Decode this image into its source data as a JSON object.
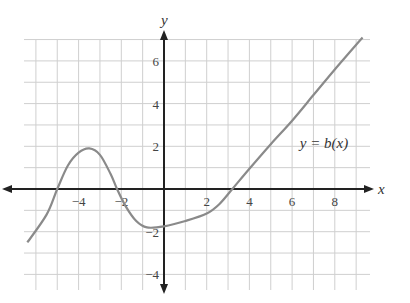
{
  "chart_data": {
    "type": "line",
    "title": "",
    "xlabel": "x",
    "ylabel": "y",
    "function_label": "y = b(x)",
    "xlim": [
      -6.5,
      9.5
    ],
    "ylim": [
      -4.5,
      7.5
    ],
    "grid": true,
    "x_ticks": [
      -4,
      -2,
      2,
      4,
      6,
      8
    ],
    "x_tick_labels": [
      "−4",
      "−2",
      "2",
      "4",
      "6",
      "8"
    ],
    "y_ticks": [
      6,
      4,
      2,
      -2,
      -4
    ],
    "y_tick_labels": [
      "6",
      "4",
      "2",
      "−2",
      "−4"
    ],
    "series": [
      {
        "name": "b(x)",
        "color": "#8a8a8a",
        "x": [
          -6.4,
          -5.5,
          -5.0,
          -4.5,
          -4.0,
          -3.5,
          -3.0,
          -2.5,
          -2.2,
          -1.8,
          -1.3,
          -0.8,
          0,
          1,
          2,
          2.6,
          3.2,
          4,
          5,
          6,
          7,
          8,
          9.3
        ],
        "y": [
          -2.5,
          -1.2,
          0,
          1.1,
          1.7,
          1.9,
          1.6,
          0.7,
          0,
          -0.8,
          -1.5,
          -1.8,
          -1.75,
          -1.5,
          -1.15,
          -0.7,
          0,
          0.95,
          2.1,
          3.2,
          4.4,
          5.6,
          7.1
        ]
      }
    ],
    "annotations": [
      {
        "text": "y = b(x)",
        "x": 6.5,
        "y": 1.9
      }
    ]
  }
}
